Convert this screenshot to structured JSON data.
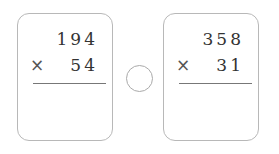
{
  "problems": [
    {
      "multiplicand": "194",
      "operator": "×",
      "multiplier": "54"
    },
    {
      "multiplicand": "358",
      "operator": "×",
      "multiplier": "31"
    }
  ],
  "comparison_circle": {
    "value": ""
  }
}
